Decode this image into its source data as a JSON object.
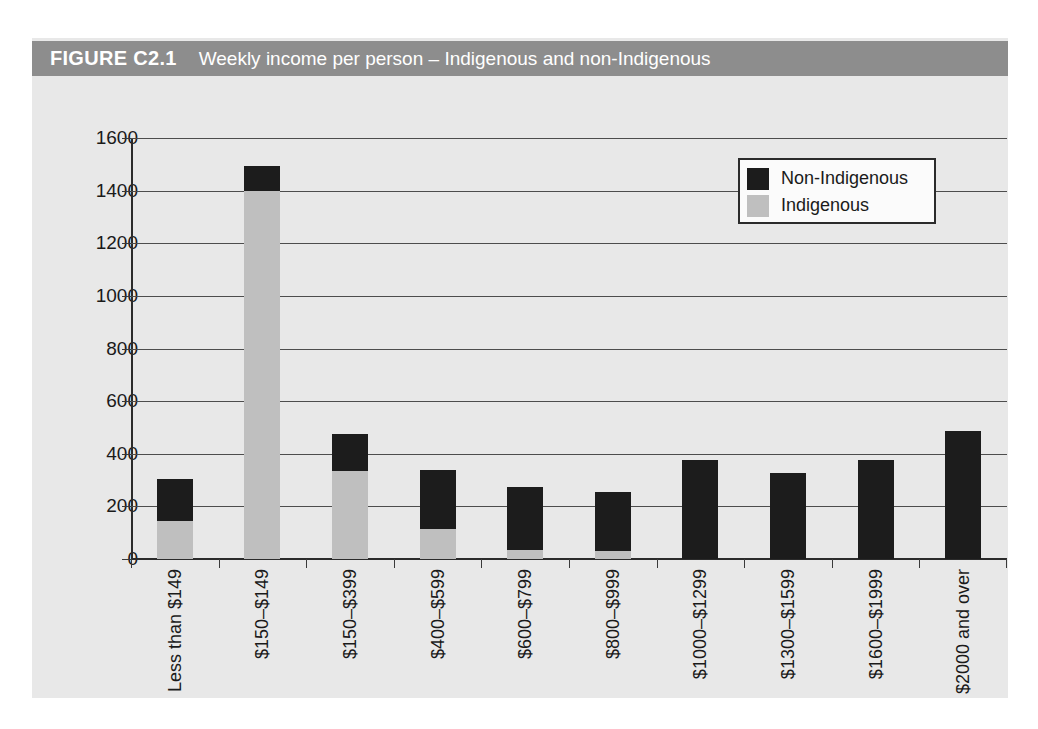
{
  "figure": {
    "number": "FIGURE C2.1",
    "caption": "Weekly income per person – Indigenous and non-Indigenous"
  },
  "colors": {
    "title_bar": "#8d8d8d",
    "figure_background": "#e8e8e8",
    "non_indigenous": "#1c1c1c",
    "indigenous": "#bfbfbf",
    "axis": "#2b2b2b",
    "gridline": "#4d4d4d"
  },
  "legend": {
    "position": "top-right",
    "entries": [
      {
        "label": "Non-Indigenous",
        "color": "#1c1c1c"
      },
      {
        "label": "Indigenous",
        "color": "#bfbfbf"
      }
    ]
  },
  "chart_data": {
    "type": "bar",
    "stacked": true,
    "title": "Weekly income per person – Indigenous and non-Indigenous",
    "xlabel": "",
    "ylabel": "",
    "ylim": [
      0,
      1600
    ],
    "yticks": [
      0,
      200,
      400,
      600,
      800,
      1000,
      1200,
      1400,
      1600
    ],
    "ytick_labels": [
      "0",
      "200",
      "400",
      "600",
      "800",
      "1000",
      "1200",
      "1400",
      "1600"
    ],
    "grid": true,
    "legend_position": "upper right",
    "categories": [
      "Less than $149",
      "$150–$149",
      "$150–$399",
      "$400–$599",
      "$600–$799",
      "$800–$999",
      "$1000–$1299",
      "$1300–$1599",
      "$1600–$1999",
      "$2000 and over"
    ],
    "series": [
      {
        "name": "Indigenous",
        "color": "#bfbfbf",
        "values": [
          145,
          1400,
          335,
          115,
          35,
          30,
          0,
          0,
          0,
          0
        ]
      },
      {
        "name": "Non-Indigenous",
        "color": "#1c1c1c",
        "values": [
          160,
          95,
          140,
          225,
          240,
          225,
          375,
          325,
          378,
          485
        ]
      }
    ],
    "totals": [
      305,
      1495,
      475,
      340,
      275,
      255,
      375,
      325,
      378,
      485
    ]
  }
}
